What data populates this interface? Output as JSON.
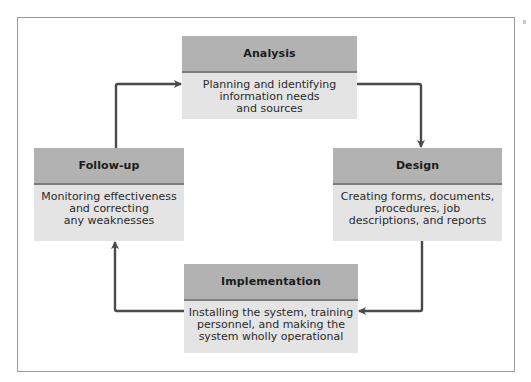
{
  "diagram": {
    "type": "cycle",
    "colors": {
      "header_fill": "#b2b2b2",
      "body_fill": "#e4e4e4",
      "divider": "#7c7c7c",
      "arrow": "#4a4a4a",
      "frame": "#9a9a9a"
    },
    "stages": [
      {
        "id": "analysis",
        "title": "Analysis",
        "description": "Planning and identifying\ninformation needs\nand sources"
      },
      {
        "id": "design",
        "title": "Design",
        "description": "Creating forms, documents,\nprocedures, job\ndescriptions, and reports"
      },
      {
        "id": "implementation",
        "title": "Implementation",
        "description": "Installing the system, training\npersonnel, and making the\nsystem wholly operational"
      },
      {
        "id": "follow-up",
        "title": "Follow-up",
        "description": "Monitoring effectiveness\nand correcting\nany weaknesses"
      }
    ],
    "flow": [
      {
        "from": "analysis",
        "to": "design"
      },
      {
        "from": "design",
        "to": "implementation"
      },
      {
        "from": "implementation",
        "to": "follow-up"
      },
      {
        "from": "follow-up",
        "to": "analysis"
      }
    ]
  }
}
